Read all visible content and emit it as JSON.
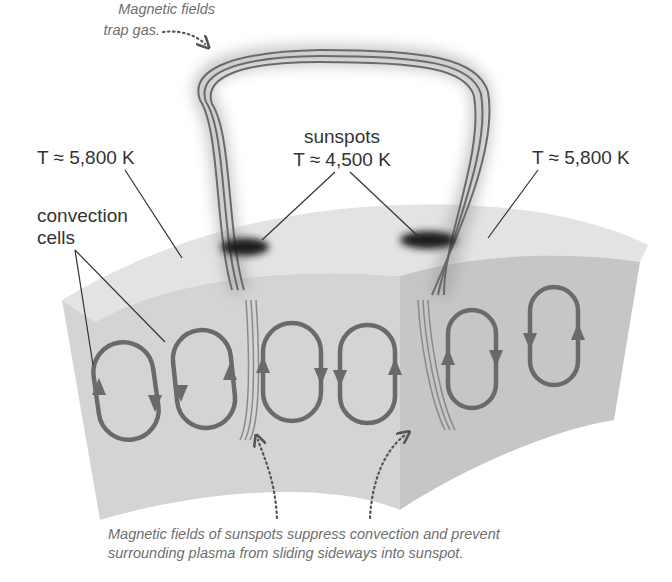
{
  "diagram": {
    "labels": {
      "trap_gas_line1": "Magnetic fields",
      "trap_gas_line2": "trap gas.",
      "temp_left": "T ≈ 5,800 K",
      "sunspots": "sunspots",
      "temp_sunspots": "T ≈ 4,500 K",
      "temp_right": "T ≈ 5,800 K",
      "convection_line1": "convection",
      "convection_line2": "cells",
      "caption_line1": "Magnetic fields of sunspots suppress convection and prevent",
      "caption_line2": "surrounding plasma from sliding sideways into sunspot."
    },
    "components": {
      "magnetic_loop": "magnetic field loop arching between two sunspots",
      "sunspots": [
        "left sunspot",
        "right sunspot"
      ],
      "convection_cells": 6,
      "block_faces": [
        "top surface",
        "front face",
        "right face"
      ]
    },
    "colors": {
      "background": "#ffffff",
      "top_surface": "#e2e2e2",
      "front_face": "#d2d2d2",
      "right_face": "#c2c2c2",
      "cell_stroke": "#6a6a6a",
      "field_lines": "#707070",
      "text": "#333333",
      "caption": "#6e6e6e",
      "sunspot": "#1a1a1a"
    }
  }
}
